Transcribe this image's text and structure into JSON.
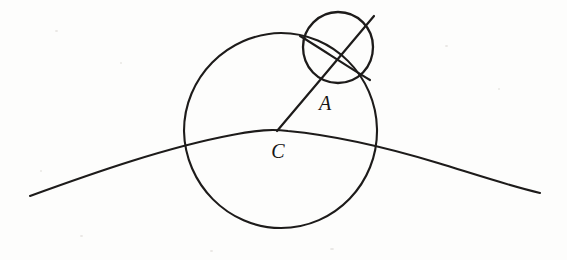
{
  "canvas": {
    "width": 567,
    "height": 260,
    "background_color": "#fdfdfc",
    "ink_color": "#1d1b1a"
  },
  "figure": {
    "title": "",
    "labels": {
      "center_label": "C",
      "point_label": "A"
    }
  },
  "shapes": {
    "large_circle": {
      "name": "large-circle",
      "center_x": 280,
      "center_y": 130,
      "radius": 97,
      "stroke_width": 2.1
    },
    "small_circle": {
      "name": "small-circle",
      "center_x": 338,
      "center_y": 47,
      "radius": 35,
      "stroke_width": 2.3
    },
    "ground_arc": {
      "name": "ground-arc",
      "start_x": 30,
      "start_y": 196,
      "apex_x": 285,
      "apex_y": 131,
      "end_x": 540,
      "end_y": 193,
      "stroke_width": 2.1
    },
    "radius_segment": {
      "name": "radius-segment",
      "from_x": 277,
      "from_y": 131,
      "to_x": 374,
      "to_y": 17,
      "stroke_width": 2.2
    },
    "chord_segment": {
      "name": "small-circle-chord",
      "from_x": 303,
      "from_y": 38,
      "to_x": 372,
      "to_y": 79,
      "stroke_width": 2.2
    }
  },
  "label_positions": {
    "A": {
      "x": 325,
      "y": 110,
      "font_size": 20
    },
    "C": {
      "x": 278,
      "y": 158,
      "font_size": 20
    }
  }
}
